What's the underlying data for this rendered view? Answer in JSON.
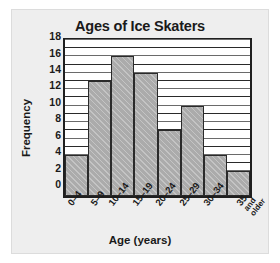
{
  "chart_data": {
    "type": "bar",
    "title": "Ages of Ice Skaters",
    "xlabel": "Age (years)",
    "ylabel": "Frequency",
    "categories": [
      "0–4",
      "5–9",
      "10–14",
      "15–19",
      "20–24",
      "25–29",
      "30–34",
      "35 and older"
    ],
    "category_lines": [
      [
        "0–4"
      ],
      [
        "5–9"
      ],
      [
        "10–14"
      ],
      [
        "15–19"
      ],
      [
        "20–24"
      ],
      [
        "25–29"
      ],
      [
        "30–34"
      ],
      [
        "35",
        "and",
        "older"
      ]
    ],
    "values": [
      5,
      14,
      17,
      15,
      8,
      11,
      5,
      3
    ],
    "ylim": [
      0,
      19
    ],
    "yticks": [
      0,
      2,
      4,
      6,
      8,
      10,
      12,
      14,
      16,
      18
    ],
    "ytick_labels": [
      "0",
      "2",
      "4",
      "6",
      "8",
      "10",
      "12",
      "14",
      "16",
      "18"
    ],
    "minor_gridline_step": 1,
    "grid": true,
    "legend": null,
    "bar_color": "#ababab",
    "bar_edge_color": "#2a2a2a",
    "plot_background": "#ffffff",
    "panel_background": "#eeeeee",
    "axis_color": "#1f1f1f"
  }
}
